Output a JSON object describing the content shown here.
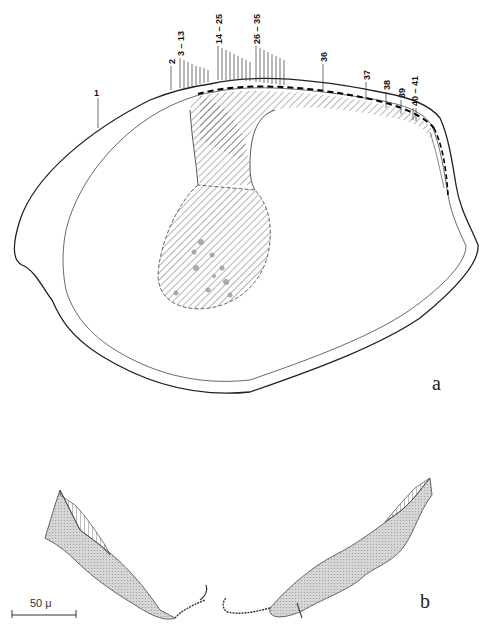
{
  "figure": {
    "panel_a": {
      "letter": "a",
      "labels": [
        "1",
        "2",
        "3 – 13",
        "14 – 25",
        "26 – 35",
        "36",
        "37",
        "38",
        "39",
        "40 – 41"
      ]
    },
    "panel_b": {
      "letter": "b"
    },
    "scale_bar": {
      "label": "50 μ"
    }
  }
}
